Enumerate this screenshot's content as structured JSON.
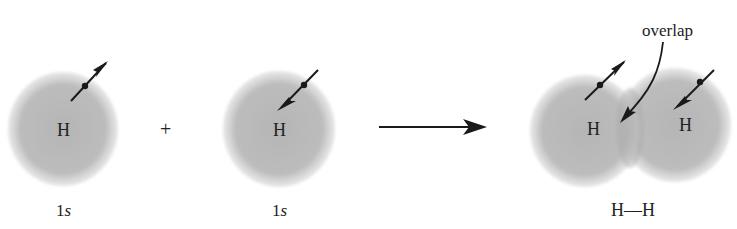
{
  "diagram": {
    "atom1": {
      "symbol": "H",
      "orbital_label_num": "1",
      "orbital_label_letter": "s",
      "spin": "up"
    },
    "plus": "+",
    "atom2": {
      "symbol": "H",
      "orbital_label_num": "1",
      "orbital_label_letter": "s",
      "spin": "down"
    },
    "reaction_arrow": "→",
    "molecule": {
      "atom_left": "H",
      "atom_right": "H",
      "overlap_label": "overlap",
      "formula": "H—H"
    },
    "colors": {
      "orbital": "#b8b8b8",
      "ink": "#1a1a1a",
      "background": "#ffffff"
    }
  }
}
